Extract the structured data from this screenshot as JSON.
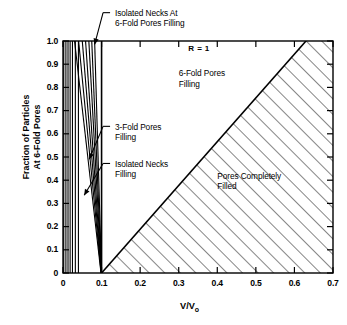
{
  "chart_data": {
    "type": "line",
    "title": "",
    "xlabel": "V/Vo",
    "xlabel_main": "V/V",
    "xlabel_sub": "o",
    "ylabel_line1": "Fraction of Particles",
    "ylabel_line2": "At 6-Fold Pores",
    "xlim": [
      0,
      0.7
    ],
    "ylim": [
      0,
      1.0
    ],
    "xticks": [
      0,
      0.1,
      0.2,
      0.3,
      0.4,
      0.5,
      0.6,
      0.7
    ],
    "xticklabels": [
      "0",
      "0.1",
      "0.2",
      "0.3",
      "0.4",
      "0.5",
      "0.6",
      "0.7"
    ],
    "yticks": [
      0,
      0.1,
      0.2,
      0.3,
      0.4,
      0.5,
      0.6,
      0.7,
      0.8,
      0.9,
      1.0
    ],
    "yticklabels": [
      "0",
      "0.1",
      "0.2",
      "0.3",
      "0.4",
      "0.5",
      "0.6",
      "0.7",
      "0.8",
      "0.9",
      "1.0"
    ],
    "grid": false,
    "legend": "none",
    "ticks_direction": "in",
    "annotations": [
      {
        "name": "isolated-necks-6fold",
        "line1": "Isolated Necks At",
        "line2": "6-Fold Pores Filling",
        "x": 0.135,
        "y": 1.12,
        "leader_to_x": 0.082,
        "leader_to_y": 0.985
      },
      {
        "name": "three-fold-pores",
        "line1": "3-Fold Pores",
        "line2": "Filling",
        "x": 0.135,
        "y": 0.63,
        "leader_to_x": 0.068,
        "leader_to_y": 0.49
      },
      {
        "name": "isolated-necks-filling",
        "line1": "Isolated Necks",
        "line2": "Filling",
        "x": 0.135,
        "y": 0.47,
        "leader_to_x": 0.055,
        "leader_to_y": 0.335
      },
      {
        "name": "six-fold-pores-region",
        "line1": "6-Fold Pores",
        "line2": "Filling",
        "x": 0.3,
        "y": 0.86
      },
      {
        "name": "pores-completely-filled-region",
        "line1": "Pores Completely",
        "line2": "Filled",
        "x": 0.4,
        "y": 0.42
      },
      {
        "name": "r-equals-one",
        "line1": "R = 1",
        "x": 0.325,
        "y": 0.965
      }
    ],
    "series": [
      {
        "name": "isolated-necks-fan",
        "comment": "near-vertical lines from left edge converging toward (0.1, 0)",
        "lines": [
          [
            [
              0.002,
              1.0
            ],
            [
              0.002,
              0.0
            ]
          ],
          [
            [
              0.0075,
              1.0
            ],
            [
              0.0075,
              0.0
            ]
          ],
          [
            [
              0.013,
              1.0
            ],
            [
              0.013,
              0.0
            ]
          ],
          [
            [
              0.0185,
              1.0
            ],
            [
              0.0185,
              0.0
            ]
          ],
          [
            [
              0.0245,
              1.0
            ],
            [
              0.0245,
              0.0
            ]
          ],
          [
            [
              0.032,
              1.0
            ],
            [
              0.032,
              0.0
            ]
          ],
          [
            [
              0.04,
              1.0
            ],
            [
              0.04,
              0.0
            ]
          ]
        ]
      },
      {
        "name": "three-fold-fan",
        "comment": "slanted lines converging at (0.1, 0)",
        "lines": [
          [
            [
              0.03,
              1.0
            ],
            [
              0.0985,
              0.0
            ]
          ],
          [
            [
              0.0405,
              1.0
            ],
            [
              0.099,
              0.0
            ]
          ],
          [
            [
              0.05,
              1.0
            ],
            [
              0.0993,
              0.0
            ]
          ],
          [
            [
              0.0585,
              1.0
            ],
            [
              0.0995,
              0.0
            ]
          ],
          [
            [
              0.067,
              1.0
            ],
            [
              0.0997,
              0.0
            ]
          ],
          [
            [
              0.0745,
              1.0
            ],
            [
              0.0998,
              0.0
            ]
          ],
          [
            [
              0.082,
              1.0
            ],
            [
              0.0999,
              0.0
            ]
          ]
        ]
      },
      {
        "name": "six-fold-boundary",
        "comment": "vertical line at V/Vo = 0.1",
        "lines": [
          [
            [
              0.1,
              1.0
            ],
            [
              0.1,
              0.0
            ]
          ]
        ]
      },
      {
        "name": "pores-completely-filled-boundary",
        "comment": "diagonal from (0.1,0) to (0.63,1.0)",
        "lines": [
          [
            [
              0.1,
              0.0
            ],
            [
              0.63,
              1.0
            ]
          ]
        ]
      }
    ],
    "hatch_region": {
      "name": "pores-completely-filled",
      "pattern": "diagonal-45",
      "vertices": [
        [
          0.1,
          0.0
        ],
        [
          0.63,
          1.0
        ],
        [
          0.7,
          1.0
        ],
        [
          0.7,
          0.0
        ]
      ]
    },
    "colors": {
      "line": "#000000",
      "background": "#ffffff",
      "text": "#000000",
      "hatch": "#333333"
    }
  }
}
